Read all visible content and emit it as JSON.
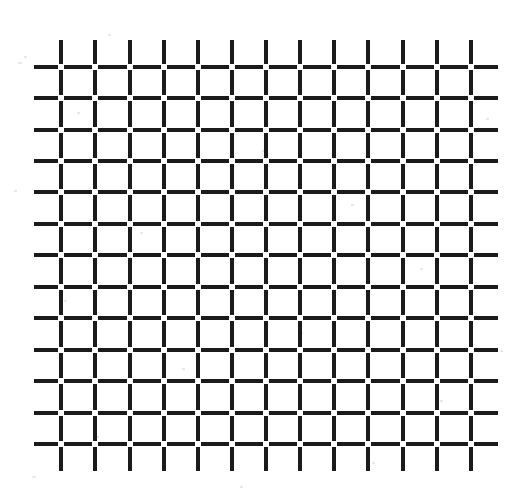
{
  "figure": {
    "kind": "optical-illusion-grid",
    "background_color": "#ffffff",
    "line_color": "#1b1b1b",
    "gap_color": "#ffffff",
    "canvas": {
      "width": 523,
      "height": 502
    }
  },
  "grid": {
    "columns": 13,
    "rows": 13,
    "first_intersection": {
      "x": 61,
      "y": 67
    },
    "last_intersection": {
      "x": 471,
      "y": 444
    },
    "pitch_x": 34.2,
    "pitch_y": 31.4,
    "line_thickness": 4,
    "intersection_gap": 6,
    "overhang": 27,
    "column_positions": [
      61,
      95,
      130,
      164,
      198,
      232,
      266,
      300,
      334,
      368,
      403,
      437,
      471
    ],
    "row_positions": [
      67,
      98,
      130,
      161,
      192,
      224,
      255,
      287,
      318,
      350,
      381,
      413,
      444
    ]
  },
  "chart_data": {
    "type": "heatmap",
    "xlabel": "",
    "ylabel": "",
    "categories": [],
    "values": [],
    "grid": true,
    "legend": "none"
  }
}
